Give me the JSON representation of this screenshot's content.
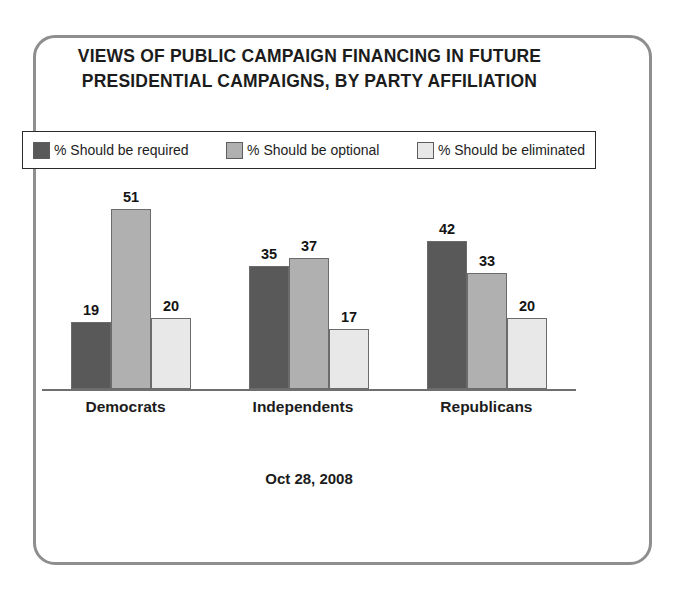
{
  "frame": {
    "border_color": "#8e8e8e",
    "background": "#ffffff"
  },
  "title": {
    "line1": "VIEWS OF PUBLIC CAMPAIGN FINANCING IN FUTURE",
    "line2": "PRESIDENTIAL CAMPAIGNS, BY PARTY AFFILIATION"
  },
  "footer": {
    "date": "Oct 28, 2008"
  },
  "chart_data": {
    "type": "bar",
    "title": "VIEWS OF PUBLIC CAMPAIGN FINANCING IN FUTURE PRESIDENTIAL CAMPAIGNS, BY PARTY AFFILIATION",
    "subtitle": "",
    "xlabel": "",
    "ylabel": "",
    "ylim": [
      0,
      55
    ],
    "grid": false,
    "legend_position": "top",
    "orientation": "vertical",
    "grouped": true,
    "categories": [
      "Democrats",
      "Independents",
      "Republicans"
    ],
    "series": [
      {
        "name": "% Should be required",
        "color": "#595959",
        "values": [
          19,
          35,
          42
        ]
      },
      {
        "name": "% Should be optional",
        "color": "#b0b0b0",
        "values": [
          51,
          37,
          33
        ]
      },
      {
        "name": "% Should be eliminated",
        "color": "#e8e8e8",
        "values": [
          20,
          17,
          20
        ]
      }
    ],
    "annotations": [
      "Oct 28, 2008"
    ]
  }
}
